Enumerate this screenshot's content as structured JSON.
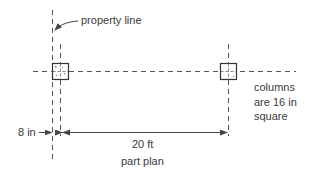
{
  "diagram": {
    "type": "structural part plan",
    "labels": {
      "property_line": "property line",
      "columns_note_1": "columns",
      "columns_note_2": "are 16 in",
      "columns_note_3": "square",
      "offset_dim": "8 in",
      "span_dim": "20 ft",
      "caption": "part plan"
    },
    "elements": {
      "columns": [
        {
          "name": "left-column",
          "size": "16 in square",
          "position": "at property line"
        },
        {
          "name": "right-column",
          "size": "16 in square",
          "position": "20 ft from left column center"
        }
      ],
      "dimensions": [
        {
          "name": "offset",
          "value": "8 in",
          "from": "property line",
          "to": "left column centerline"
        },
        {
          "name": "span",
          "value": "20 ft",
          "from": "left column centerline",
          "to": "right column centerline"
        }
      ]
    },
    "colors": {
      "line": "#444444",
      "text": "#3a3a3a",
      "background": "#ffffff"
    }
  }
}
